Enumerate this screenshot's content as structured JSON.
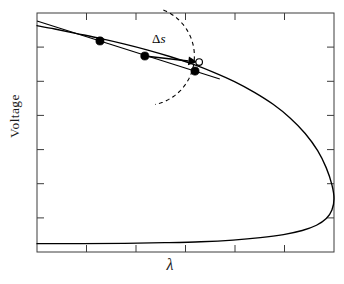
{
  "figure": {
    "name": "bifurcation-diagram",
    "background_color": "#ffffff",
    "frame_color": "#3c3c3c",
    "curve_color": "#000000"
  },
  "axes": {
    "x_label": "λ",
    "y_label": "Voltage",
    "x_tick_count": 5,
    "y_tick_count": 6,
    "frame": {
      "left": 37,
      "top": 13,
      "right": 334,
      "bottom": 252
    },
    "ticks_inward": true,
    "tick_labels_shown": false,
    "grid": false
  },
  "annotations": {
    "step_label": "Δs",
    "step_label_delta": "Δ",
    "step_label_variable": "s",
    "arrow_name": "tangent-predictor-arrow",
    "arc_name": "corrector-arc"
  },
  "chart_data": {
    "type": "line",
    "title": "",
    "subtitle": "",
    "xlabel": "λ",
    "ylabel": "Voltage",
    "xlim": [
      0,
      1
    ],
    "ylim": [
      0,
      1
    ],
    "grid": false,
    "legend": "none",
    "series": [
      {
        "name": "solution-branch",
        "style": "solid",
        "color": "#000000",
        "points": [
          {
            "x": 0.0,
            "y": 0.947
          },
          {
            "x": 0.06,
            "y": 0.933
          },
          {
            "x": 0.13,
            "y": 0.915
          },
          {
            "x": 0.212,
            "y": 0.894
          },
          {
            "x": 0.292,
            "y": 0.871
          },
          {
            "x": 0.37,
            "y": 0.846
          },
          {
            "x": 0.447,
            "y": 0.818
          },
          {
            "x": 0.522,
            "y": 0.787
          },
          {
            "x": 0.595,
            "y": 0.752
          },
          {
            "x": 0.665,
            "y": 0.713
          },
          {
            "x": 0.732,
            "y": 0.668
          },
          {
            "x": 0.795,
            "y": 0.618
          },
          {
            "x": 0.853,
            "y": 0.56
          },
          {
            "x": 0.903,
            "y": 0.496
          },
          {
            "x": 0.945,
            "y": 0.424
          },
          {
            "x": 0.974,
            "y": 0.352
          },
          {
            "x": 0.993,
            "y": 0.281
          },
          {
            "x": 1.0,
            "y": 0.223
          },
          {
            "x": 0.993,
            "y": 0.176
          },
          {
            "x": 0.974,
            "y": 0.14
          },
          {
            "x": 0.941,
            "y": 0.112
          },
          {
            "x": 0.893,
            "y": 0.09
          },
          {
            "x": 0.83,
            "y": 0.073
          },
          {
            "x": 0.752,
            "y": 0.06
          },
          {
            "x": 0.66,
            "y": 0.05
          },
          {
            "x": 0.552,
            "y": 0.043
          },
          {
            "x": 0.43,
            "y": 0.039
          },
          {
            "x": 0.295,
            "y": 0.036
          },
          {
            "x": 0.15,
            "y": 0.035
          },
          {
            "x": 0.0,
            "y": 0.035
          }
        ]
      }
    ],
    "markers": [
      {
        "name": "solution-point-1",
        "kind": "filled",
        "x": 0.212,
        "y": 0.883
      },
      {
        "name": "solution-point-2",
        "kind": "filled",
        "x": 0.363,
        "y": 0.82
      },
      {
        "name": "solution-point-3",
        "kind": "filled",
        "x": 0.532,
        "y": 0.757
      },
      {
        "name": "predicted-point",
        "kind": "open",
        "x": 0.546,
        "y": 0.795
      }
    ],
    "annotations": [
      {
        "name": "tangent-predictor-arrow",
        "kind": "arrow",
        "label": "Δs",
        "from": {
          "x": 0.363,
          "y": 0.82
        },
        "to": {
          "x": 0.54,
          "y": 0.795
        }
      },
      {
        "name": "corrector-arc",
        "kind": "dashed-arc",
        "center": {
          "x": 0.363,
          "y": 0.82
        },
        "radius": 0.185,
        "start_angle_deg": 68,
        "end_angle_deg": -78
      }
    ]
  }
}
